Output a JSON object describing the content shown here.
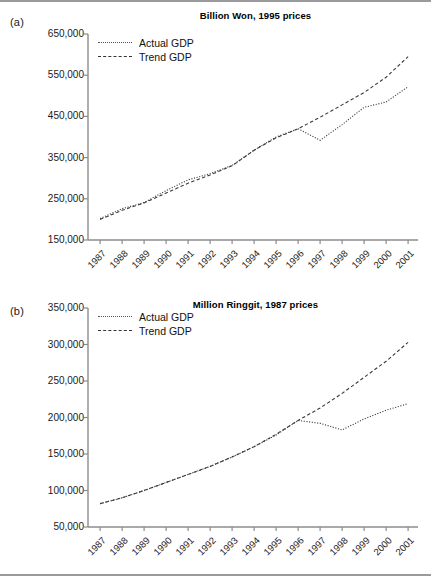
{
  "figure": {
    "panels": [
      {
        "id": "a",
        "label": "(a)",
        "title": "Billion Won, 1995 prices",
        "legend": [
          {
            "name": "series-actual",
            "label": "Actual GDP",
            "style": "dotted"
          },
          {
            "name": "series-trend",
            "label": "Trend GDP",
            "style": "dashed"
          }
        ]
      },
      {
        "id": "b",
        "label": "(b)",
        "title": "Million Ringgit, 1987 prices",
        "legend": [
          {
            "name": "series-actual",
            "label": "Actual GDP",
            "style": "dotted"
          },
          {
            "name": "series-trend",
            "label": "Trend GDP",
            "style": "dashed"
          }
        ]
      }
    ]
  },
  "chart_data": [
    {
      "type": "line",
      "panel": "a",
      "title": "Billion Won, 1995 prices",
      "xlabel": "",
      "ylabel": "",
      "ylim": [
        150000,
        650000
      ],
      "yticks": [
        150000,
        250000,
        350000,
        450000,
        550000,
        650000
      ],
      "ytick_labels": [
        "150,000",
        "250,000",
        "350,000",
        "450,000",
        "550,000",
        "650,000"
      ],
      "grid": false,
      "legend_position": "top-left",
      "x": [
        1987,
        1988,
        1989,
        1990,
        1991,
        1992,
        1993,
        1994,
        1995,
        1996,
        1997,
        1998,
        1999,
        2000,
        2001
      ],
      "xtick_labels": [
        "1987",
        "1988",
        "1989",
        "1990",
        "1991",
        "1992",
        "1993",
        "1994",
        "1995",
        "1996",
        "1997",
        "1998",
        "1999",
        "2000",
        "2001"
      ],
      "series": [
        {
          "name": "Actual GDP",
          "style": "dotted",
          "values": [
            202000,
            226000,
            241000,
            270000,
            296000,
            311000,
            331000,
            368000,
            400000,
            420000,
            392000,
            430000,
            472000,
            485000,
            522000
          ]
        },
        {
          "name": "Trend GDP",
          "style": "dashed",
          "values": [
            200000,
            222000,
            240000,
            264000,
            288000,
            308000,
            330000,
            368000,
            398000,
            420000,
            448000,
            478000,
            508000,
            545000,
            595000
          ]
        }
      ]
    },
    {
      "type": "line",
      "panel": "b",
      "title": "Million Ringgit, 1987 prices",
      "xlabel": "",
      "ylabel": "",
      "ylim": [
        50000,
        350000
      ],
      "yticks": [
        50000,
        100000,
        150000,
        200000,
        250000,
        300000,
        350000
      ],
      "ytick_labels": [
        "50,000",
        "100,000",
        "150,000",
        "200,000",
        "250,000",
        "300,000",
        "350,000"
      ],
      "grid": false,
      "legend_position": "top-left",
      "x": [
        1987,
        1988,
        1989,
        1990,
        1991,
        1992,
        1993,
        1994,
        1995,
        1996,
        1997,
        1998,
        1999,
        2000,
        2001
      ],
      "xtick_labels": [
        "1987",
        "1988",
        "1989",
        "1990",
        "1991",
        "1992",
        "1993",
        "1994",
        "1995",
        "1996",
        "1997",
        "1998",
        "1999",
        "2000",
        "2001"
      ],
      "series": [
        {
          "name": "Actual GDP",
          "style": "dotted",
          "values": [
            82000,
            90000,
            100000,
            111000,
            122000,
            133000,
            146000,
            160000,
            176000,
            196000,
            192000,
            183000,
            198000,
            210000,
            219000
          ]
        },
        {
          "name": "Trend GDP",
          "style": "dashed",
          "values": [
            82000,
            90000,
            100000,
            111000,
            122000,
            133000,
            146000,
            160000,
            177000,
            196000,
            213000,
            233000,
            255000,
            277000,
            303000
          ]
        }
      ]
    }
  ]
}
